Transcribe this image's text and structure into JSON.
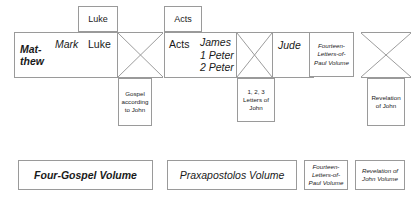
{
  "diagram": {
    "colors": {
      "border": "#9a9a9a",
      "background": "#ffffff",
      "text": "#1a1a1a"
    },
    "tabs": [
      {
        "label": "Luke"
      },
      {
        "label": "Acts"
      }
    ],
    "four_gospel_block": {
      "items": [
        {
          "label": "Mat-\nthew",
          "style": "bold-italic"
        },
        {
          "label": "Mark",
          "style": "italic"
        },
        {
          "label": "Luke",
          "style": "regular"
        }
      ]
    },
    "gospel_john_box": {
      "label": "Gospel according to John"
    },
    "praxapostolos_block": {
      "acts_label": "Acts",
      "catholic_letters": [
        {
          "label": "James"
        },
        {
          "label": "1 Peter"
        },
        {
          "label": "2 Peter"
        }
      ],
      "jude_label": "Jude"
    },
    "letters_of_john_box": {
      "label": "1, 2, 3 Letters of John"
    },
    "paul_volume_box": {
      "label": "Fourteen-Letters-of-Paul Volume"
    },
    "revelation_box": {
      "label": "Revelation of John"
    },
    "bottom_volumes": [
      {
        "label": "Four-Gospel Volume",
        "size": "large"
      },
      {
        "label": "Praxapostolos Volume",
        "size": "large"
      },
      {
        "label": "Fourteen-Letters-of-Paul Volume",
        "size": "small"
      },
      {
        "label": "Revelation of John Volume",
        "size": "small"
      }
    ]
  }
}
